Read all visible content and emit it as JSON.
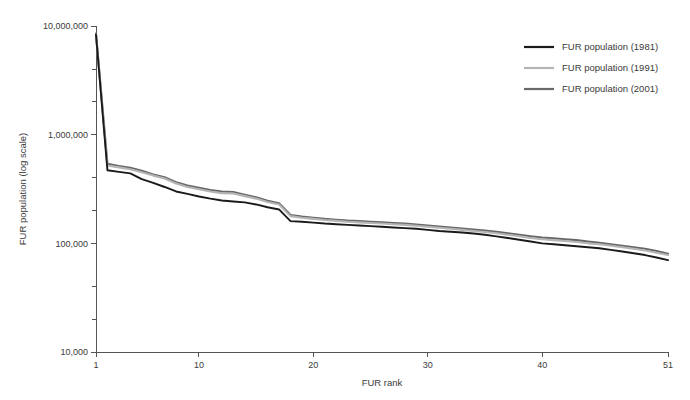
{
  "chart_data": {
    "type": "line",
    "title": "",
    "subtitle": "",
    "xlabel": "FUR rank",
    "ylabel": "FUR population (log scale)",
    "yscale": "log",
    "ylim": [
      10000,
      10000000
    ],
    "xlim": [
      1,
      51
    ],
    "grid": false,
    "legend_position": "top-right",
    "y_ticks": [
      {
        "value": 10000,
        "label": "10,000"
      },
      {
        "value": 100000,
        "label": "100,000"
      },
      {
        "value": 1000000,
        "label": "1,000,000"
      },
      {
        "value": 10000000,
        "label": "10,000,000"
      }
    ],
    "y_minor_ticks": [
      2000000,
      4000000,
      200000,
      400000,
      20000,
      40000
    ],
    "x_ticks": [
      {
        "value": 1,
        "label": "1"
      },
      {
        "value": 10,
        "label": "10"
      },
      {
        "value": 20,
        "label": "20"
      },
      {
        "value": 30,
        "label": "30"
      },
      {
        "value": 40,
        "label": "40"
      },
      {
        "value": 51,
        "label": "51"
      }
    ],
    "x": [
      1,
      2,
      3,
      4,
      5,
      6,
      7,
      8,
      9,
      10,
      11,
      12,
      13,
      14,
      15,
      16,
      17,
      18,
      19,
      20,
      21,
      22,
      23,
      24,
      25,
      26,
      27,
      28,
      29,
      30,
      31,
      32,
      33,
      34,
      35,
      36,
      37,
      38,
      39,
      40,
      41,
      42,
      43,
      44,
      45,
      46,
      47,
      48,
      49,
      50,
      51
    ],
    "series": [
      {
        "name": "FUR population (1981)",
        "color": "#1a1a1a",
        "width": 1.9,
        "values": [
          8300000,
          470000,
          455000,
          440000,
          390000,
          360000,
          330000,
          300000,
          285000,
          270000,
          258000,
          248000,
          243000,
          238000,
          228000,
          215000,
          205000,
          160000,
          158000,
          155000,
          152000,
          150000,
          148000,
          146000,
          144000,
          142000,
          140000,
          138000,
          136000,
          133000,
          130000,
          128000,
          126000,
          123000,
          120000,
          116000,
          112000,
          108000,
          104000,
          100000,
          98000,
          96000,
          94000,
          92000,
          90000,
          87000,
          84000,
          81000,
          78000,
          74000,
          70000
        ]
      },
      {
        "name": "FUR population (1991)",
        "color": "#b4b4b4",
        "width": 2.1,
        "values": [
          8300000,
          520000,
          500000,
          480000,
          450000,
          420000,
          395000,
          355000,
          330000,
          315000,
          300000,
          290000,
          288000,
          272000,
          258000,
          240000,
          228000,
          178000,
          172000,
          168000,
          164000,
          161000,
          158000,
          156000,
          154000,
          152000,
          150000,
          148000,
          145000,
          142000,
          139000,
          136000,
          133000,
          130000,
          127000,
          124000,
          120000,
          116000,
          112000,
          109000,
          107000,
          105000,
          103000,
          100000,
          98000,
          95000,
          92000,
          89000,
          86000,
          82000,
          78000
        ]
      },
      {
        "name": "FUR population (2001)",
        "color": "#686868",
        "width": 2.1,
        "values": [
          8500000,
          540000,
          515000,
          495000,
          465000,
          430000,
          405000,
          365000,
          340000,
          325000,
          310000,
          300000,
          296000,
          280000,
          265000,
          246000,
          234000,
          182000,
          176000,
          172000,
          168000,
          165000,
          162000,
          160000,
          158000,
          156000,
          154000,
          152000,
          149000,
          146000,
          143000,
          140000,
          137000,
          134000,
          131000,
          128000,
          124000,
          120000,
          116000,
          113000,
          111000,
          109000,
          107000,
          104000,
          101000,
          98000,
          95000,
          92000,
          89000,
          85000,
          80000
        ]
      }
    ],
    "legend": [
      {
        "label": "FUR population (1981)",
        "color": "#1a1a1a"
      },
      {
        "label": "FUR population (1991)",
        "color": "#b4b4b4"
      },
      {
        "label": "FUR population (2001)",
        "color": "#686868"
      }
    ]
  },
  "colors": {
    "background": "#ffffff",
    "axis": "#555555",
    "text": "#3a3a3a"
  }
}
